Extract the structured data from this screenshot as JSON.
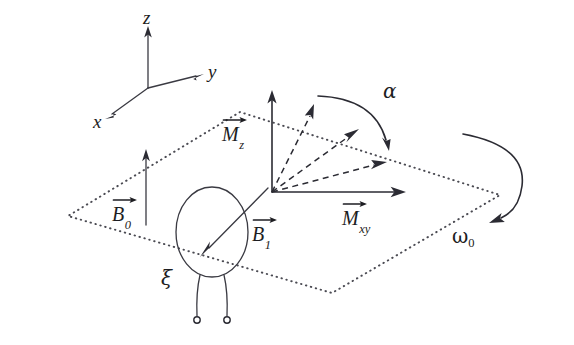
{
  "figure": {
    "background_color": "#ffffff",
    "ink_color": "#2b2b33"
  },
  "axes": {
    "z_label": "z",
    "y_label": "y",
    "x_label": "x"
  },
  "vectors": {
    "mz": {
      "base": "M",
      "sub": "z"
    },
    "mxy": {
      "base": "M",
      "sub": "xy"
    },
    "b0": {
      "base": "B",
      "sub": "0"
    },
    "b1": {
      "base": "B",
      "sub": "1"
    }
  },
  "angles": {
    "alpha": "α",
    "omega_base": "ω",
    "omega_sub": "0"
  },
  "coil": {
    "xi_label": "ξ"
  }
}
